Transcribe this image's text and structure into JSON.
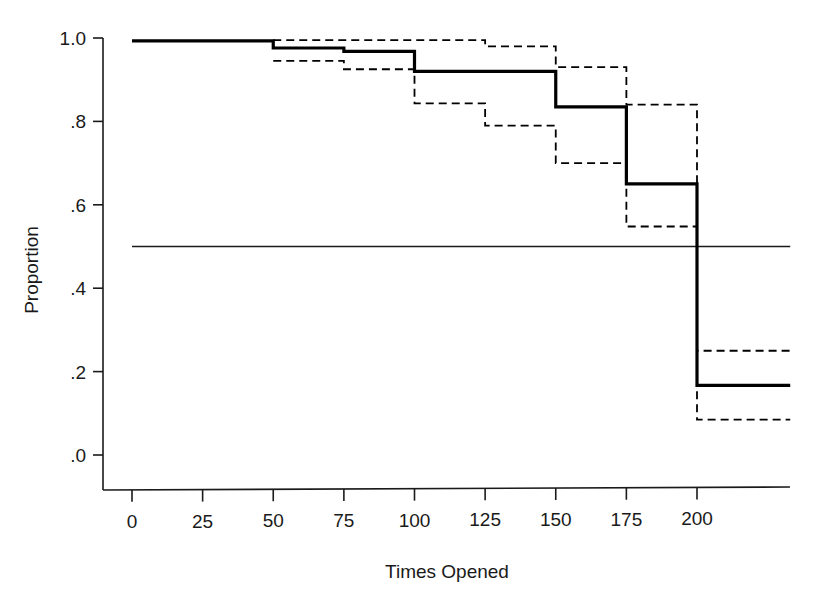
{
  "chart_data": {
    "type": "line",
    "subtype": "kaplan-meier-step",
    "title": "",
    "xlabel": "Times Opened",
    "ylabel": "Proportion",
    "xlim": [
      0,
      235
    ],
    "ylim": [
      -0.085,
      1.0
    ],
    "grid": false,
    "legend": null,
    "xticks": [
      0,
      25,
      50,
      75,
      100,
      125,
      150,
      175,
      200
    ],
    "xticklabels": [
      "0",
      "25",
      "50",
      "75",
      "100",
      "125",
      "150",
      "175",
      "200"
    ],
    "yticks": [
      0.0,
      0.2,
      0.4,
      0.6,
      0.8,
      1.0
    ],
    "yticklabels": [
      ".0",
      ".2",
      ".4",
      ".6",
      ".8",
      "1.0"
    ],
    "reference_line": {
      "y": 0.5,
      "orientation": "horizontal",
      "style": "solid",
      "extent_x": [
        0,
        233
      ]
    },
    "series": [
      {
        "name": "survival-estimate",
        "style": "solid",
        "width": 3.2,
        "color": "#000000",
        "x": [
          0,
          50,
          50,
          75,
          75,
          100,
          100,
          125,
          125,
          150,
          150,
          175,
          175,
          200,
          200,
          233
        ],
        "y": [
          0.993,
          0.993,
          0.976,
          0.976,
          0.968,
          0.968,
          0.92,
          0.92,
          0.92,
          0.92,
          0.835,
          0.835,
          0.65,
          0.65,
          0.167,
          0.167
        ]
      },
      {
        "name": "upper-confidence-limit",
        "style": "dashed",
        "width": 1.8,
        "color": "#000000",
        "x": [
          50,
          75,
          75,
          100,
          100,
          125,
          125,
          150,
          150,
          175,
          175,
          200,
          200,
          233
        ],
        "y": [
          0.995,
          0.995,
          0.995,
          0.995,
          0.995,
          0.995,
          0.98,
          0.98,
          0.93,
          0.93,
          0.84,
          0.84,
          0.25,
          0.25
        ]
      },
      {
        "name": "lower-confidence-limit",
        "style": "dashed",
        "width": 1.8,
        "color": "#000000",
        "x": [
          50,
          75,
          75,
          100,
          100,
          125,
          125,
          150,
          150,
          175,
          175,
          200,
          200,
          233
        ],
        "y": [
          0.945,
          0.945,
          0.925,
          0.925,
          0.843,
          0.843,
          0.79,
          0.79,
          0.7,
          0.7,
          0.548,
          0.548,
          0.085,
          0.085
        ]
      }
    ],
    "step_table": {
      "columns": [
        "Times Opened",
        "Proportion",
        "Upper CI",
        "Lower CI"
      ],
      "rows": [
        [
          "0",
          "0.993",
          "",
          ""
        ],
        [
          "50",
          "0.976",
          "0.995",
          "0.945"
        ],
        [
          "75",
          "0.968",
          "0.995",
          "0.925"
        ],
        [
          "100",
          "0.920",
          "0.995",
          "0.843"
        ],
        [
          "125",
          "0.920",
          "0.980",
          "0.790"
        ],
        [
          "150",
          "0.835",
          "0.930",
          "0.700"
        ],
        [
          "175",
          "0.650",
          "0.840",
          "0.548"
        ],
        [
          "200",
          "0.167",
          "0.250",
          "0.085"
        ]
      ]
    }
  },
  "figure": {
    "background": "#ffffff",
    "ink": "#000000",
    "axis_color": "#1a1a1a"
  }
}
